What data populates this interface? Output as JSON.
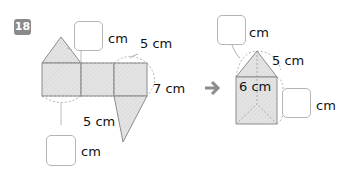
{
  "problem": {
    "number": "18",
    "badge_color": "#8a8a8a"
  },
  "net_figure": {
    "unit_label_top": "cm",
    "slant_label": "5 cm",
    "height_label": "7 cm",
    "base_label": "5 cm",
    "unit_label_bottom": "cm",
    "answer_box_top": "",
    "answer_box_bottom": ""
  },
  "arrow": "➔",
  "prism_figure": {
    "unit_label_top": "cm",
    "slant_label": "5 cm",
    "base_label": "6 cm",
    "unit_label_right": "cm",
    "answer_box_top": "",
    "answer_box_right": ""
  },
  "colors": {
    "fill": "#e2e2e2",
    "outline": "#8c8c8c",
    "dashed": "#9a9a9a",
    "arrow": "#8c8c8c"
  }
}
